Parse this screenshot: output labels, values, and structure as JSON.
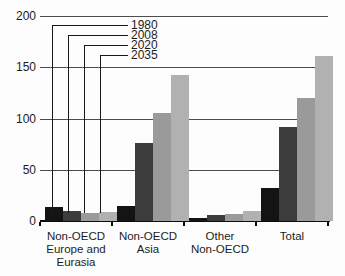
{
  "chart_data": {
    "type": "bar",
    "categories": [
      "Non-OECD Europe and Eurasia",
      "Non-OECD Asia",
      "Other Non-OECD",
      "Total"
    ],
    "category_lines": [
      [
        "Non-OECD",
        "Europe and",
        "Eurasia"
      ],
      [
        "Non-OECD",
        "Asia"
      ],
      [
        "Other",
        "Non-OECD"
      ],
      [
        "Total"
      ]
    ],
    "series": [
      {
        "name": "1980",
        "color": "#141414",
        "values": [
          14,
          15,
          3,
          32
        ]
      },
      {
        "name": "2008",
        "color": "#3c3c3c",
        "values": [
          10,
          76,
          6,
          92
        ]
      },
      {
        "name": "2020",
        "color": "#9a9a9a",
        "values": [
          8,
          105,
          7,
          120
        ]
      },
      {
        "name": "2035",
        "color": "#b1b1b1",
        "values": [
          9,
          142,
          10,
          161
        ]
      }
    ],
    "ylim": [
      0,
      200
    ],
    "yticks": [
      0,
      50,
      100,
      150,
      200
    ],
    "grid": true,
    "legend_position": "upper-left-callouts"
  },
  "colors": {
    "background": "#fdfdfd",
    "gridline": "#4d4d4d",
    "axis": "#0d0d0d",
    "text": "#1c1c1c"
  }
}
